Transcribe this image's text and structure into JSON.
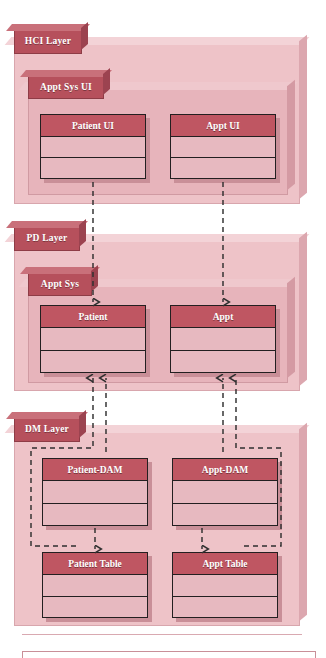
{
  "diagram": {
    "type": "uml-package-layer-diagram",
    "colors": {
      "layer_panel": "#eec3c8",
      "package_panel": "#e7b4bb",
      "tab_fill": "#b6505c",
      "class_header": "#bf5662",
      "class_body": "#e7b9c0",
      "class_border": "#231f20",
      "connector": "#3a3a3a"
    }
  },
  "layers": [
    {
      "id": "hci",
      "tab_label": "HCI Layer",
      "package": {
        "tab_label": "Appt Sys UI"
      },
      "classes": [
        {
          "name": "Patient UI",
          "compartments": 2
        },
        {
          "name": "Appt UI",
          "compartments": 2
        }
      ]
    },
    {
      "id": "pd",
      "tab_label": "PD Layer",
      "package": {
        "tab_label": "Appt Sys"
      },
      "classes": [
        {
          "name": "Patient",
          "compartments": 2
        },
        {
          "name": "Appt",
          "compartments": 2
        }
      ]
    },
    {
      "id": "dm",
      "tab_label": "DM Layer",
      "package": {
        "tab_label": ""
      },
      "classes": [
        {
          "name": "Patient-DAM",
          "compartments": 2
        },
        {
          "name": "Appt-DAM",
          "compartments": 2
        },
        {
          "name": "Patient Table",
          "compartments": 2
        },
        {
          "name": "Appt Table",
          "compartments": 2
        }
      ]
    }
  ],
  "connectors": [
    {
      "from": "Patient UI",
      "to": "Patient",
      "style": "dashed",
      "arrow": "open-down"
    },
    {
      "from": "Appt UI",
      "to": "Appt",
      "style": "dashed",
      "arrow": "open-down"
    },
    {
      "from": "Patient-DAM",
      "to": "Patient",
      "style": "dashed",
      "arrow": "open-up"
    },
    {
      "from": "Patient Table",
      "to": "Patient",
      "style": "dashed",
      "arrow": "open-up"
    },
    {
      "from": "Appt-DAM",
      "to": "Appt",
      "style": "dashed",
      "arrow": "open-up"
    },
    {
      "from": "Appt Table",
      "to": "Appt",
      "style": "dashed",
      "arrow": "open-up"
    },
    {
      "from": "Patient-DAM",
      "to": "Patient Table",
      "style": "dashed",
      "arrow": "open-down"
    },
    {
      "from": "Appt-DAM",
      "to": "Appt Table",
      "style": "dashed",
      "arrow": "open-down"
    }
  ]
}
